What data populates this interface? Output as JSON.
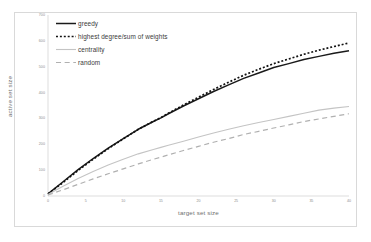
{
  "chart_data": {
    "type": "line",
    "title": "",
    "xlabel": "target set size",
    "ylabel": "active set size",
    "xlim": [
      0,
      40
    ],
    "ylim": [
      0,
      700
    ],
    "grid": false,
    "legend_position": "upper left",
    "x_ticks": [
      "0",
      "5",
      "10",
      "15",
      "20",
      "25",
      "30",
      "35",
      "40"
    ],
    "y_ticks": [
      "700",
      "600",
      "500",
      "400",
      "300",
      "200",
      "100",
      "0"
    ],
    "x": [
      0,
      2,
      4,
      6,
      8,
      10,
      12,
      14,
      15,
      16,
      18,
      20,
      22,
      24,
      26,
      28,
      30,
      32,
      34,
      36,
      38,
      40
    ],
    "series": [
      {
        "name": "greedy",
        "style": "solid",
        "color": "#1a1a1a",
        "width": 1.5,
        "values": [
          8,
          55,
          102,
          145,
          185,
          222,
          258,
          288,
          302,
          318,
          348,
          376,
          404,
          430,
          455,
          476,
          497,
          512,
          528,
          540,
          552,
          562
        ]
      },
      {
        "name": "highest degree/sum of weights",
        "style": "dotted",
        "color": "#111111",
        "width": 1.7,
        "values": [
          8,
          52,
          99,
          142,
          183,
          221,
          258,
          289,
          303,
          320,
          352,
          382,
          412,
          440,
          467,
          490,
          512,
          530,
          548,
          564,
          578,
          592
        ]
      },
      {
        "name": "centrality",
        "style": "solid",
        "color": "#c4c4c4",
        "width": 1.1,
        "values": [
          6,
          38,
          68,
          95,
          120,
          142,
          163,
          180,
          188,
          196,
          212,
          228,
          244,
          258,
          272,
          284,
          296,
          308,
          320,
          332,
          340,
          346
        ]
      },
      {
        "name": "random",
        "style": "dashed",
        "color": "#b0b0b0",
        "width": 1.2,
        "values": [
          4,
          24,
          45,
          66,
          86,
          105,
          124,
          142,
          150,
          159,
          176,
          192,
          208,
          222,
          238,
          250,
          263,
          275,
          288,
          298,
          308,
          318
        ]
      }
    ]
  },
  "axes": {
    "x_title": "target set size",
    "y_title": "active set size"
  },
  "legend": {
    "items": [
      {
        "label": "greedy"
      },
      {
        "label": "highest degree/sum of weights"
      },
      {
        "label": "centrality"
      },
      {
        "label": "random"
      }
    ]
  }
}
